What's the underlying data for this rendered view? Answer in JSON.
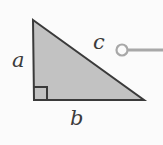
{
  "figure": {
    "name": "right-triangle-pythagorean-diagram",
    "background_color": "#fbfbfb"
  },
  "triangle": {
    "fill_color": "#c2c2c2",
    "stroke_color": "#3a3a3a",
    "stroke_width": 2,
    "vertices": [
      {
        "name": "apex",
        "x": 33,
        "y": 20
      },
      {
        "name": "bottom-right",
        "x": 144,
        "y": 100
      },
      {
        "name": "bottom-left",
        "x": 34,
        "y": 100
      }
    ]
  },
  "right_angle_marker": {
    "x": 34,
    "y": 87,
    "size": 13,
    "stroke_color": "#3a3a3a"
  },
  "labels": {
    "leg_a": "a",
    "leg_b": "b",
    "hypotenuse_c": "c"
  },
  "handle": {
    "circle": {
      "cx": 122,
      "cy": 50,
      "r": 5.5
    },
    "color": "#a8a8a8",
    "line": {
      "x1": 127,
      "y1": 50,
      "x2": 163,
      "y2": 50,
      "width": 3
    }
  }
}
